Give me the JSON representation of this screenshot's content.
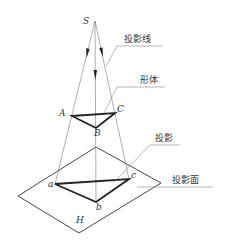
{
  "diagram": {
    "points": {
      "source": "S",
      "object_vertices": [
        "A",
        "B",
        "C"
      ],
      "projection_vertices": [
        "a",
        "b",
        "c"
      ],
      "plane": "H"
    },
    "annotations": {
      "projection_line": "投影线",
      "object": "形体",
      "projection": "投影",
      "projection_plane": "投影面"
    },
    "colors": {
      "line": "#777777",
      "bold": "#222222",
      "text": "#333333"
    }
  }
}
